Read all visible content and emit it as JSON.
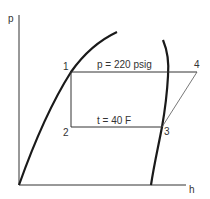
{
  "diagram": {
    "type": "pressure-enthalpy diagram",
    "axes": {
      "y_label": "p",
      "x_label": "h"
    },
    "points": [
      {
        "id": "1",
        "label": "1"
      },
      {
        "id": "2",
        "label": "2"
      },
      {
        "id": "3",
        "label": "3"
      },
      {
        "id": "4",
        "label": "4"
      }
    ],
    "annotations": {
      "high_pressure_line": "p = 220 psig",
      "low_temperature_line": "t = 40 F"
    },
    "colors": {
      "line": "#1a1a1a",
      "thin_line": "#444444",
      "text": "#333333",
      "background": "#ffffff"
    }
  }
}
